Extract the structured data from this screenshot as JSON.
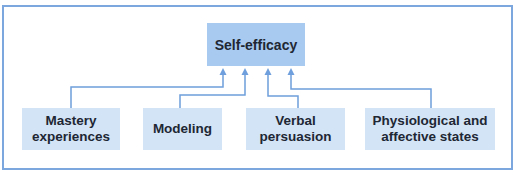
{
  "diagram": {
    "root": {
      "label": "Self-efficacy"
    },
    "sources": [
      {
        "label": "Mastery experiences"
      },
      {
        "label": "Modeling"
      },
      {
        "label": "Verbal persuasion"
      },
      {
        "label": "Physiological and affective states"
      }
    ],
    "colors": {
      "frame": "#7BA6DE",
      "connector": "#6F9FDC",
      "root_fill": "#A8CAF0",
      "source_fill": "#D2E4F6",
      "text": "#1E2733"
    }
  }
}
